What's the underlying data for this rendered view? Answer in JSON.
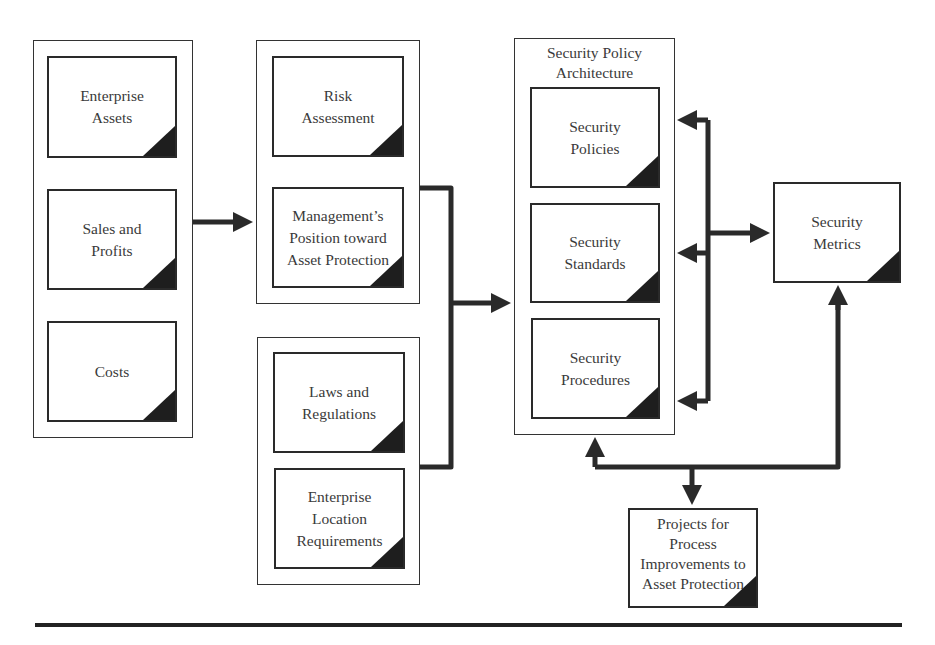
{
  "diagram": {
    "groups": {
      "business": {
        "items": [
          "Enterprise\nAssets",
          "Sales and\nProfits",
          "Costs"
        ]
      },
      "management": {
        "items": [
          "Risk\nAssessment",
          "Management’s\nPosition toward\nAsset Protection"
        ]
      },
      "legal": {
        "items": [
          "Laws and\nRegulations",
          "Enterprise\nLocation\nRequirements"
        ]
      },
      "architecture": {
        "title": "Security Policy\nArchitecture",
        "items": [
          "Security\nPolicies",
          "Security\nStandards",
          "Security\nProcedures"
        ]
      }
    },
    "metrics": {
      "label": "Security\nMetrics"
    },
    "projects": {
      "label": "Projects for\nProcess\nImprovements to\nAsset Protection"
    },
    "colors": {
      "line": "#2a2a2a",
      "corner": "#1e1e1e",
      "text": "#3a3a3a"
    }
  }
}
